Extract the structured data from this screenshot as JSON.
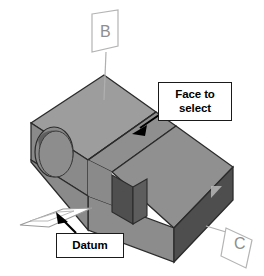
{
  "figure": {
    "background_color": "#ffffff",
    "width": 264,
    "height": 276
  },
  "callouts": [
    {
      "id": "face-to-select",
      "line1": "Face to",
      "line2": "select",
      "text": "Face to select",
      "box_color": "#ffffff",
      "border_color": "#1a1a1a",
      "text_color": "#000000",
      "arrow": {
        "from_x": 162,
        "from_y": 112,
        "to_x": 136,
        "to_y": 130,
        "color": "#000000"
      }
    },
    {
      "id": "datum",
      "line1": "Datum",
      "line2": "",
      "text": "Datum",
      "box_color": "#ffffff",
      "border_color": "#1a1a1a",
      "text_color": "#000000",
      "arrow": {
        "from_x": 76,
        "from_y": 232,
        "to_x": 58,
        "to_y": 215,
        "color": "#000000"
      }
    }
  ],
  "datum_flags": [
    {
      "id": "flag-b",
      "label": "B",
      "label_color": "#8e8e8e",
      "outline_color": "#b4b4b4",
      "leader_from_x": 106,
      "leader_from_y": 52,
      "leader_to_x": 104,
      "leader_to_y": 98
    },
    {
      "id": "flag-c",
      "label": "C",
      "label_color": "#8e8e8e",
      "outline_color": "#b4b4b4",
      "leader_from_x": 226,
      "leader_from_y": 231,
      "leader_to_x": 207,
      "leader_to_y": 225
    }
  ],
  "solid": {
    "name": "bracket-block",
    "face_colors": {
      "top_left": "#9d9d9d",
      "top_right": "#8c8c8c",
      "ramp": "#8f8f8f",
      "front_left": "#878787",
      "front_long": "#8a8a8a",
      "slot_left": "#4f4f4f",
      "slot_back": "#616161",
      "end_face": "#4e4e4e",
      "hole_wall": "#6f6f6f",
      "hole_floor": "#8a8a8a"
    },
    "edge_color": "#2b2b2b",
    "features": [
      {
        "name": "through-hole",
        "shape": "ellipse",
        "cx": 54,
        "cy": 152,
        "rx": 19,
        "ry": 25
      },
      {
        "name": "sloped-ramp-face",
        "shape": "quad"
      },
      {
        "name": "rectangular-slot",
        "shape": "quad"
      }
    ]
  },
  "datum_plane": {
    "name": "datum-plane-sketch",
    "outline_color": "#8e8e8e",
    "fill_color": "#ffffff"
  }
}
